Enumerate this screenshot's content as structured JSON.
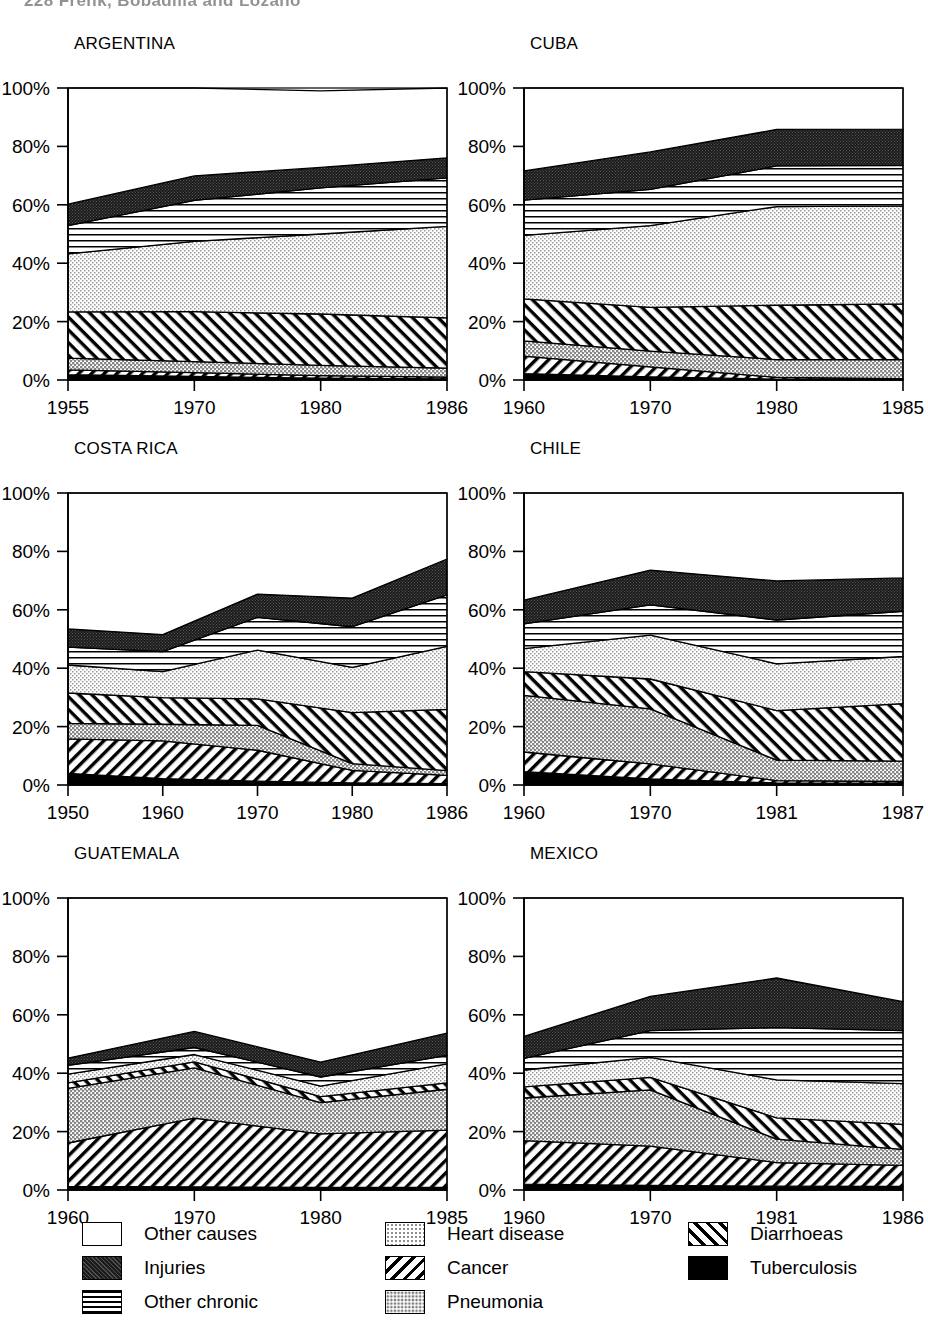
{
  "running_head": "228   Frenk, Bobadilla and Lozano",
  "axis": {
    "y_ticks": [
      "0%",
      "20%",
      "40%",
      "60%",
      "80%",
      "100%"
    ],
    "y_values": [
      0,
      20,
      40,
      60,
      80,
      100
    ],
    "ylim": [
      0,
      100
    ]
  },
  "legend": {
    "columns": [
      [
        {
          "key": "other_causes",
          "label": "Other causes",
          "pattern": "solid-white"
        },
        {
          "key": "injuries",
          "label": "Injuries",
          "pattern": "dark-speckle"
        },
        {
          "key": "other_chronic",
          "label": "Other chronic",
          "pattern": "horizontal-lines"
        }
      ],
      [
        {
          "key": "heart_disease",
          "label": "Heart disease",
          "pattern": "light-dots"
        },
        {
          "key": "cancer",
          "label": "Cancer",
          "pattern": "backslash-hatch"
        },
        {
          "key": "pneumonia",
          "label": "Pneumonia",
          "pattern": "mid-grey"
        }
      ],
      [
        {
          "key": "diarrhoeas",
          "label": "Diarrhoeas",
          "pattern": "forwardslash-hatch"
        },
        {
          "key": "tuberculosis",
          "label": "Tuberculosis",
          "pattern": "solid-black"
        }
      ]
    ]
  },
  "series_order_bottom_to_top": [
    "tuberculosis",
    "diarrhoeas",
    "pneumonia",
    "cancer",
    "heart_disease",
    "other_chronic",
    "injuries",
    "other_causes"
  ],
  "chart_data": [
    {
      "type": "area",
      "title": "ARGENTINA",
      "xlabel": "",
      "ylabel": "",
      "ylim": [
        0,
        100
      ],
      "grid": false,
      "stacked": true,
      "x": [
        "1955",
        "1970",
        "1980",
        "1986"
      ],
      "series": [
        {
          "name": "Tuberculosis",
          "values": [
            1.8,
            1.2,
            0.6,
            0.4
          ]
        },
        {
          "name": "Diarrhoeas",
          "values": [
            1.7,
            1.3,
            0.9,
            0.6
          ]
        },
        {
          "name": "Pneumonia",
          "values": [
            4.0,
            3.8,
            3.5,
            3.1
          ]
        },
        {
          "name": "Cancer",
          "values": [
            15.8,
            17.1,
            17.6,
            17.2
          ]
        },
        {
          "name": "Heart disease",
          "values": [
            19.9,
            24.1,
            27.4,
            31.3
          ]
        },
        {
          "name": "Other chronic",
          "values": [
            9.7,
            14.0,
            15.8,
            16.6
          ]
        },
        {
          "name": "Injuries",
          "values": [
            7.3,
            8.4,
            7.0,
            6.9
          ]
        },
        {
          "name": "Other causes",
          "values": [
            39.8,
            30.1,
            26.2,
            23.9
          ]
        }
      ]
    },
    {
      "type": "area",
      "title": "CUBA",
      "xlabel": "",
      "ylabel": "",
      "ylim": [
        0,
        100
      ],
      "grid": false,
      "stacked": true,
      "x": [
        "1960",
        "1970",
        "1980",
        "1985"
      ],
      "series": [
        {
          "name": "Tuberculosis",
          "values": [
            2.2,
            1.1,
            0.3,
            0.2
          ]
        },
        {
          "name": "Diarrhoeas",
          "values": [
            6.0,
            3.4,
            0.6,
            0.3
          ]
        },
        {
          "name": "Pneumonia",
          "values": [
            5.2,
            5.4,
            6.1,
            6.5
          ]
        },
        {
          "name": "Cancer",
          "values": [
            14.4,
            15.0,
            18.6,
            19.1
          ]
        },
        {
          "name": "Heart disease",
          "values": [
            21.7,
            28.0,
            33.8,
            33.5
          ]
        },
        {
          "name": "Other chronic",
          "values": [
            12.1,
            12.4,
            13.9,
            13.9
          ]
        },
        {
          "name": "Injuries",
          "values": [
            10.0,
            12.8,
            12.5,
            12.4
          ]
        },
        {
          "name": "Other causes",
          "values": [
            28.4,
            21.9,
            14.2,
            14.1
          ]
        }
      ]
    },
    {
      "type": "area",
      "title": "COSTA RICA",
      "xlabel": "",
      "ylabel": "",
      "ylim": [
        0,
        100
      ],
      "grid": false,
      "stacked": true,
      "x": [
        "1950",
        "1960",
        "1970",
        "1980",
        "1986"
      ],
      "series": [
        {
          "name": "Tuberculosis",
          "values": [
            4.0,
            2.2,
            1.3,
            0.7,
            0.5
          ]
        },
        {
          "name": "Diarrhoeas",
          "values": [
            11.8,
            12.9,
            10.6,
            4.3,
            2.8
          ]
        },
        {
          "name": "Pneumonia",
          "values": [
            5.3,
            5.7,
            8.5,
            2.3,
            1.6
          ]
        },
        {
          "name": "Cancer",
          "values": [
            10.4,
            9.1,
            9.1,
            17.5,
            21.0
          ]
        },
        {
          "name": "Heart disease",
          "values": [
            9.6,
            8.9,
            16.7,
            15.5,
            21.6
          ]
        },
        {
          "name": "Other chronic",
          "values": [
            6.1,
            6.9,
            11.2,
            13.9,
            17.6
          ]
        },
        {
          "name": "Injuries",
          "values": [
            6.3,
            5.8,
            8.0,
            9.8,
            12.3
          ]
        },
        {
          "name": "Other causes",
          "values": [
            46.5,
            48.5,
            34.6,
            36.0,
            22.6
          ]
        }
      ]
    },
    {
      "type": "area",
      "title": "CHILE",
      "xlabel": "",
      "ylabel": "",
      "ylim": [
        0,
        100
      ],
      "grid": false,
      "stacked": true,
      "x": [
        "1960",
        "1970",
        "1981",
        "1987"
      ],
      "series": [
        {
          "name": "Tuberculosis",
          "values": [
            4.6,
            2.1,
            0.7,
            0.6
          ]
        },
        {
          "name": "Diarrhoeas",
          "values": [
            6.7,
            5.1,
            0.8,
            0.6
          ]
        },
        {
          "name": "Pneumonia",
          "values": [
            19.4,
            18.9,
            7.0,
            7.0
          ]
        },
        {
          "name": "Cancer",
          "values": [
            8.1,
            10.2,
            17.0,
            19.7
          ]
        },
        {
          "name": "Heart disease",
          "values": [
            7.9,
            15.0,
            16.0,
            16.1
          ]
        },
        {
          "name": "Other chronic",
          "values": [
            8.5,
            10.4,
            15.0,
            15.5
          ]
        },
        {
          "name": "Injuries",
          "values": [
            8.1,
            11.9,
            13.4,
            11.4
          ]
        },
        {
          "name": "Other causes",
          "values": [
            36.7,
            26.4,
            30.1,
            29.1
          ]
        }
      ]
    },
    {
      "type": "area",
      "title": "GUATEMALA",
      "xlabel": "",
      "ylabel": "",
      "ylim": [
        0,
        100
      ],
      "grid": false,
      "stacked": true,
      "x": [
        "1960",
        "1970",
        "1980",
        "1985"
      ],
      "series": [
        {
          "name": "Tuberculosis",
          "values": [
            1.2,
            1.1,
            0.9,
            0.9
          ]
        },
        {
          "name": "Diarrhoeas",
          "values": [
            14.9,
            23.5,
            18.3,
            19.6
          ]
        },
        {
          "name": "Pneumonia",
          "values": [
            18.7,
            17.2,
            10.7,
            14.0
          ]
        },
        {
          "name": "Cancer",
          "values": [
            1.9,
            2.1,
            2.1,
            2.2
          ]
        },
        {
          "name": "Heart disease",
          "values": [
            3.0,
            2.5,
            3.6,
            6.5
          ]
        },
        {
          "name": "Other chronic",
          "values": [
            3.0,
            2.4,
            3.1,
            2.9
          ]
        },
        {
          "name": "Injuries",
          "values": [
            2.5,
            5.5,
            5.1,
            7.6
          ]
        },
        {
          "name": "Other causes",
          "values": [
            54.8,
            45.7,
            56.2,
            46.3
          ]
        }
      ]
    },
    {
      "type": "area",
      "title": "MEXICO",
      "xlabel": "",
      "ylabel": "",
      "ylim": [
        0,
        100
      ],
      "grid": false,
      "stacked": true,
      "x": [
        "1960",
        "1970",
        "1981",
        "1986"
      ],
      "series": [
        {
          "name": "Tuberculosis",
          "values": [
            2.0,
            1.6,
            1.3,
            1.2
          ]
        },
        {
          "name": "Diarrhoeas",
          "values": [
            14.9,
            13.4,
            8.1,
            7.2
          ]
        },
        {
          "name": "Pneumonia",
          "values": [
            14.6,
            19.3,
            8.0,
            5.5
          ]
        },
        {
          "name": "Cancer",
          "values": [
            3.8,
            4.3,
            7.3,
            8.6
          ]
        },
        {
          "name": "Heart disease",
          "values": [
            5.8,
            6.8,
            13.0,
            13.9
          ]
        },
        {
          "name": "Other chronic",
          "values": [
            4.0,
            9.2,
            17.9,
            18.2
          ]
        },
        {
          "name": "Injuries",
          "values": [
            7.5,
            11.7,
            17.0,
            9.9
          ]
        },
        {
          "name": "Other causes",
          "values": [
            47.4,
            33.7,
            27.4,
            35.5
          ]
        }
      ]
    }
  ]
}
